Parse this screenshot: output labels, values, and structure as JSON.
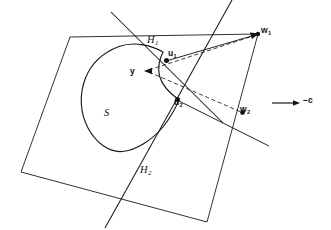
{
  "figure": {
    "background_color": "#ffffff",
    "ink_color": "#1a1a1a",
    "labels": {
      "hyperplane_1": "H",
      "hyperplane_1_sub": "1",
      "hyperplane_2": "H",
      "hyperplane_2_sub": "2",
      "set": "S",
      "point_y": "y",
      "point_u1": "u",
      "point_u1_sub": "1",
      "point_u2": "u",
      "point_u2_sub": "2",
      "point_w1": "w",
      "point_w1_sub": "1",
      "point_w2": "w",
      "point_w2_sub": "2",
      "direction_vector": "−c"
    },
    "elements": {
      "plane": "quadrilateral",
      "set_shape": "closed-convex-blob-with-notch",
      "tangent_lines": 2,
      "dashed_rays": 2,
      "solid_rays": 2,
      "marked_points": 5,
      "direction_arrow": "rightward"
    },
    "geometry": {
      "plane_quad": "70,37 258,34 207,222 21,172",
      "blob_path": "M 163,52 C 150,44 134,42 120,47 C 104,52 92,63 86,78 C 79,95 80,113 88,128 C 96,143 110,152 122,151 C 136,150 152,140 163,127 C 172,116 178,104 178,98 C 170,93 162,84 160,76 C 158,68 160,58 163,52 Z",
      "hyperplane_1": "111,12 222,122",
      "hyperplane_2": "232,0 105,228",
      "ray_y_to_w1": "145,71 258,34",
      "ray_y_to_w2": "145,71 243,113",
      "ray_u1_to_w1": "167,61 258,34",
      "ray_u2_to_w2": "178,100 243,113",
      "ray_w2_extend": "243,113 268,145",
      "ray_u1_upleft": "167,61 126,27",
      "arrow_line": "272,103 299,103",
      "points": {
        "y": "145,71",
        "u1": "167,61",
        "u2": "178,100",
        "w1": "258,34",
        "w2": "243,113"
      }
    }
  }
}
